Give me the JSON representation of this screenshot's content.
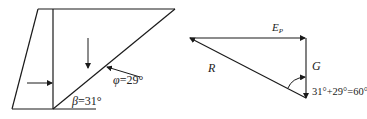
{
  "left_diagram": {
    "phi_label": "φ=29°",
    "beta_label": "β=31°"
  },
  "right_diagram": {
    "ep_label_main": "E",
    "ep_label_sub": "P",
    "r_label": "R",
    "g_label": "G",
    "angle_label": "31°+29°=60°"
  },
  "colors": {
    "line": "#1a1a1a",
    "text": "#222222"
  }
}
